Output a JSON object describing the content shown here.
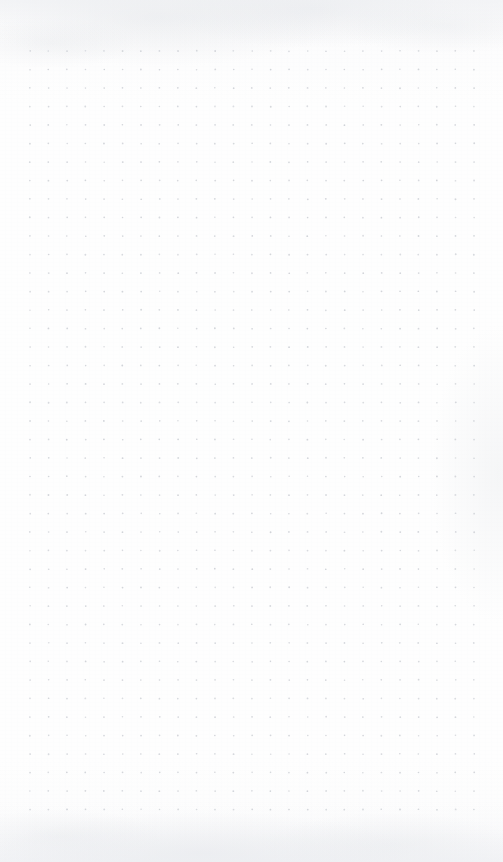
{
  "page": {
    "kind": "dot-grid-notebook-page",
    "width_px": 503,
    "height_px": 862,
    "background_color": "#fdfdfd",
    "content_text": "",
    "notes_label": ""
  },
  "grid": {
    "columns": 25,
    "rows": 42,
    "spacing_px": 18.5,
    "origin_x_px": 30,
    "origin_y_px": 51,
    "dot_radius_px": 0.85,
    "dot_color": "#c9ccd2",
    "dot_opacity": 0.85
  },
  "margins": {
    "left_px": 30,
    "right_px": 29,
    "top_px": 51,
    "bottom_px": 56
  },
  "texture": {
    "top_band_color": "#ecedf1",
    "bottom_band_color": "#eaecf0",
    "grain_color": "#f0f1f3"
  }
}
